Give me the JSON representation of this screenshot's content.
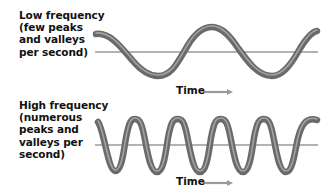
{
  "panels": {
    "low": {
      "title_lines": [
        "Low frequency",
        "(few peaks",
        "and valleys",
        "per second)"
      ],
      "axis_label": "Time",
      "arrow": "time-arrow-icon",
      "cycles_shown": 2
    },
    "high": {
      "title_lines": [
        "High frequency",
        "(numerous",
        "peaks and",
        "valleys per",
        "second)"
      ],
      "axis_label": "Time",
      "arrow": "time-arrow-icon",
      "cycles_shown": 5
    }
  },
  "colors": {
    "wave": "#6e6e6e",
    "wave_highlight": "#a8a8a8",
    "baseline": "#9a9a9a",
    "arrow": "#9a9a9a",
    "text": "#111111"
  }
}
